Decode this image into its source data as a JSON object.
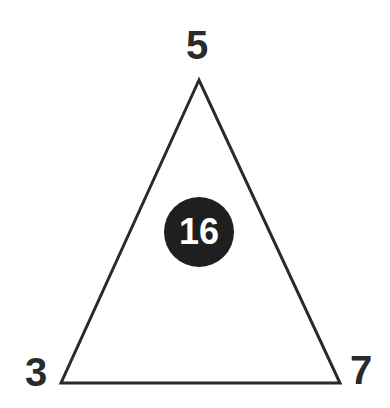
{
  "puzzle": {
    "top_value": "5",
    "left_value": "3",
    "right_value": "7",
    "center_value": "16"
  },
  "colors": {
    "stroke": "#2a2a2a",
    "circle_fill": "#1f1f1f",
    "center_text": "#ffffff"
  }
}
